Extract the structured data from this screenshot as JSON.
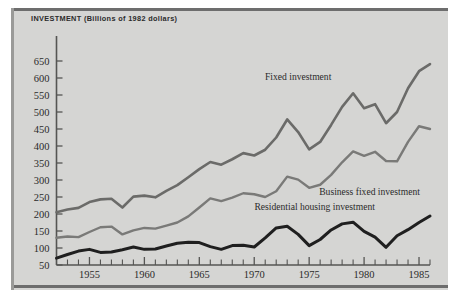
{
  "figure": {
    "axis_title": "INVESTMENT (Billions of 1982 dollars)",
    "background_color": "#d5d5d3",
    "frame_color": "#6d6d6d"
  },
  "labels": {
    "fixed_investment": "Fixed investment",
    "business_fixed_investment": "Business fixed investment",
    "residential_housing_investment": "Residential housing investment"
  },
  "chart_data": {
    "type": "line",
    "title": "INVESTMENT (Billions of 1982 dollars)",
    "xlabel": "",
    "ylabel": "INVESTMENT (Billions of 1982 dollars)",
    "xlim": [
      1952,
      1986
    ],
    "ylim": [
      50,
      670
    ],
    "yticks": [
      50,
      100,
      150,
      200,
      250,
      300,
      350,
      400,
      450,
      500,
      550,
      600,
      650
    ],
    "ytick_labels": [
      "50",
      "100",
      "150",
      "200",
      "250",
      "300",
      "350",
      "400",
      "450",
      "500",
      "550",
      "600",
      "650"
    ],
    "xticks": [
      1952,
      1953,
      1954,
      1955,
      1956,
      1957,
      1958,
      1959,
      1960,
      1961,
      1962,
      1963,
      1964,
      1965,
      1966,
      1967,
      1968,
      1969,
      1970,
      1971,
      1972,
      1973,
      1974,
      1975,
      1976,
      1977,
      1978,
      1979,
      1980,
      1981,
      1982,
      1983,
      1984,
      1985,
      1986
    ],
    "xtick_labels": [
      "1955",
      "1960",
      "1965",
      "1970",
      "1975",
      "1980",
      "1985"
    ],
    "xtick_label_years": [
      1955,
      1960,
      1965,
      1970,
      1975,
      1980,
      1985
    ],
    "grid": false,
    "legend_position": "inline-annotations",
    "x": [
      1952,
      1953,
      1954,
      1955,
      1956,
      1957,
      1958,
      1959,
      1960,
      1961,
      1962,
      1963,
      1964,
      1965,
      1966,
      1967,
      1968,
      1969,
      1970,
      1971,
      1972,
      1973,
      1974,
      1975,
      1976,
      1977,
      1978,
      1979,
      1980,
      1981,
      1982,
      1983,
      1984,
      1985,
      1986
    ],
    "series": [
      {
        "name": "Fixed investment",
        "color": "#6b6b69",
        "line_width": 2.6,
        "values": [
          205,
          213,
          218,
          235,
          243,
          245,
          219,
          251,
          254,
          249,
          268,
          285,
          308,
          332,
          353,
          345,
          361,
          379,
          372,
          389,
          425,
          478,
          441,
          390,
          412,
          462,
          515,
          555,
          511,
          523,
          467,
          500,
          570,
          620,
          641
        ]
      },
      {
        "name": "Business fixed investment",
        "color": "#7a7a78",
        "line_width": 2.4,
        "values": [
          130,
          134,
          132,
          147,
          161,
          163,
          140,
          152,
          159,
          157,
          166,
          175,
          193,
          219,
          246,
          238,
          248,
          261,
          258,
          250,
          267,
          310,
          301,
          277,
          286,
          315,
          352,
          384,
          371,
          383,
          356,
          355,
          412,
          458,
          450
        ]
      },
      {
        "name": "Residential housing investment",
        "color": "#1f1f1f",
        "line_width": 3.0,
        "values": [
          70,
          81,
          91,
          96,
          87,
          88,
          95,
          103,
          96,
          97,
          106,
          114,
          117,
          116,
          104,
          96,
          107,
          108,
          103,
          130,
          159,
          164,
          140,
          107,
          125,
          153,
          171,
          176,
          149,
          132,
          102,
          136,
          154,
          175,
          194
        ]
      }
    ],
    "annotations": [
      {
        "text": "Fixed investment",
        "x": 1974,
        "y": 595
      },
      {
        "text": "Business fixed investment",
        "x": 1980.5,
        "y": 255
      },
      {
        "text": "Residential housing investment",
        "x": 1975.5,
        "y": 212
      }
    ]
  }
}
